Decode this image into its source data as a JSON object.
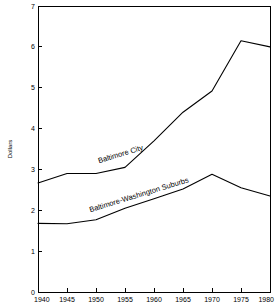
{
  "chart_data": {
    "type": "line",
    "title": "",
    "subtitle": "",
    "xlabel": "",
    "ylabel": "Dollars",
    "x": [
      1940,
      1945,
      1950,
      1955,
      1960,
      1965,
      1970,
      1975,
      1980
    ],
    "xtick_labels": [
      "1940",
      "1945",
      "1950",
      "1955",
      "1960",
      "1965",
      "1970",
      "1975",
      "1980"
    ],
    "ytick_labels": [
      "0",
      "1",
      "2",
      "3",
      "4",
      "5",
      "6",
      "7"
    ],
    "yticks": [
      0,
      1,
      2,
      3,
      4,
      5,
      6,
      7
    ],
    "xlim": [
      1940,
      1980
    ],
    "ylim": [
      0,
      7
    ],
    "grid": false,
    "legend_position": "inline-labels",
    "series": [
      {
        "name": "Baltimore City",
        "label": "Baltimore City",
        "color": "#000000",
        "values": [
          2.67,
          2.9,
          2.9,
          3.05,
          3.7,
          4.4,
          4.92,
          6.15,
          6.0
        ]
      },
      {
        "name": "Baltimore-Washington Suburbs",
        "label": "Baltimore-Washington Suburbs",
        "color": "#000000",
        "values": [
          1.68,
          1.67,
          1.77,
          2.05,
          2.28,
          2.52,
          2.88,
          2.55,
          2.35
        ]
      }
    ],
    "annotations": [
      {
        "text": "Baltimore City",
        "x": 1950.5,
        "y": 3.15,
        "rotation": -17
      },
      {
        "text": "Baltimore-Washington Suburbs",
        "x": 1949.0,
        "y": 1.95,
        "rotation": -17
      }
    ]
  }
}
